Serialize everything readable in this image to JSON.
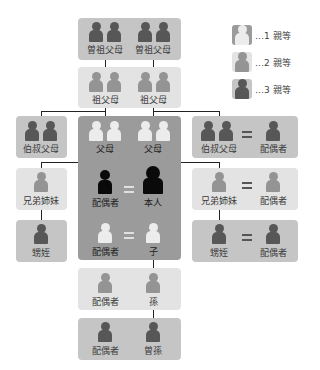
{
  "legend": [
    {
      "text": "…1 親等",
      "degree": 1
    },
    {
      "text": "…2 親等",
      "degree": 2
    },
    {
      "text": "…3 親等",
      "degree": 3
    }
  ],
  "nodes": {
    "great_grandparents": {
      "left": "曽祖父母",
      "right": "曽祖父母"
    },
    "grandparents": {
      "left": "祖父母",
      "right": "祖父母"
    },
    "parents": {
      "left": "父母",
      "right": "父母"
    },
    "uncle_aunt_left": "伯叔父母",
    "uncle_aunt_right": {
      "relative": "伯叔父母",
      "spouse": "配偶者"
    },
    "siblings_left": "兄弟姉妹",
    "siblings_right": {
      "relative": "兄弟姉妹",
      "spouse": "配偶者"
    },
    "nephews_left": "甥姪",
    "nephews_right": {
      "relative": "甥姪",
      "spouse": "配偶者"
    },
    "self_row": {
      "spouse": "配偶者",
      "self": "本人"
    },
    "child_row": {
      "spouse": "配偶者",
      "child": "子"
    },
    "grandchild_row": {
      "spouse": "配偶者",
      "grandchild": "孫"
    },
    "great_grandchild_row": {
      "spouse": "配偶者",
      "great_grandchild": "曽孫"
    }
  },
  "colors": {
    "degree1_bg": "#9b9b9b",
    "degree2_bg": "#e3e3e3",
    "degree3_bg": "#c5c5c5",
    "degree1_person": "#ececec",
    "degree2_person": "#949494",
    "degree3_person": "#575757",
    "self_person": "#0a0a0a"
  }
}
